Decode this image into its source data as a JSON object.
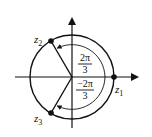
{
  "diagram": {
    "points": [
      {
        "id": "z1",
        "label": "z",
        "subscript": "1"
      },
      {
        "id": "z2",
        "label": "z",
        "subscript": "2"
      },
      {
        "id": "z3",
        "label": "z",
        "subscript": "3"
      }
    ],
    "angles": [
      {
        "numerator": "2π",
        "denominator": "3"
      },
      {
        "numerator": "−2π",
        "denominator": "3"
      }
    ],
    "colors": {
      "stroke": "#111111",
      "background": "#ffffff"
    }
  }
}
